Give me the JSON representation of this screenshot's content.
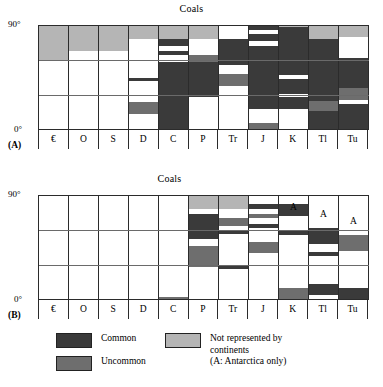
{
  "figure": {
    "panels": [
      {
        "id": "A",
        "label": "(A)",
        "title": "Coals",
        "y_axis": {
          "top": "90°",
          "bottom": "0°",
          "min": 0,
          "max": 90,
          "gridlines": [
            30,
            60
          ]
        },
        "x_axis": {
          "categories": [
            "€",
            "O",
            "S",
            "D",
            "C",
            "P",
            "Tr",
            "J",
            "K",
            "Tl",
            "Tu"
          ]
        }
      },
      {
        "id": "B",
        "label": "(B)",
        "title": "Coals",
        "y_axis": {
          "top": "90°",
          "bottom": "0°",
          "min": 0,
          "max": 90,
          "gridlines": [
            30,
            60
          ]
        },
        "x_axis": {
          "categories": [
            "€",
            "O",
            "S",
            "D",
            "C",
            "P",
            "Tr",
            "J",
            "K",
            "Tl",
            "Tu"
          ]
        },
        "antarctica_marks": [
          {
            "column": "K",
            "label": "A",
            "lat": 84
          },
          {
            "column": "Tl",
            "label": "A",
            "lat": 78
          },
          {
            "column": "Tu",
            "label": "A",
            "lat": 72
          }
        ]
      }
    ],
    "legend": {
      "items": [
        {
          "key": "common",
          "label": "Common",
          "color": "#3a3a3a"
        },
        {
          "key": "uncommon",
          "label": "Uncommon",
          "color": "#6e6e6e"
        },
        {
          "key": "not_represented",
          "label": "Not represented by\ncontinents\n(A: Antarctica only)",
          "color": "#b5b5b5"
        }
      ]
    }
  },
  "colors": {
    "common": "#3a3a3a",
    "uncommon": "#6e6e6e",
    "not_represented": "#b5b5b5",
    "absent": "#ffffff",
    "axis": "#2b2b2b",
    "grid": "#6a6a6a"
  },
  "chart_data": {
    "type": "bar",
    "title": "Coals",
    "xlabel": "",
    "ylabel": "Latitude",
    "ylim": [
      0,
      90
    ],
    "grid": true,
    "legend_position": "bottom",
    "categories": [
      "€",
      "O",
      "S",
      "D",
      "C",
      "P",
      "Tr",
      "J",
      "K",
      "Tl",
      "Tu"
    ],
    "note": "Each column is a vertical stack of latitude bands (0-90 deg); each band has a category: common, uncommon, not_represented, or absent.",
    "panels": [
      {
        "id": "A",
        "columns": [
          {
            "name": "€",
            "bands": [
              {
                "from": 0,
                "to": 60,
                "state": "absent"
              },
              {
                "from": 60,
                "to": 90,
                "state": "not_represented"
              }
            ]
          },
          {
            "name": "O",
            "bands": [
              {
                "from": 0,
                "to": 68,
                "state": "absent"
              },
              {
                "from": 68,
                "to": 90,
                "state": "not_represented"
              }
            ]
          },
          {
            "name": "S",
            "bands": [
              {
                "from": 0,
                "to": 68,
                "state": "absent"
              },
              {
                "from": 68,
                "to": 90,
                "state": "not_represented"
              }
            ]
          },
          {
            "name": "D",
            "bands": [
              {
                "from": 0,
                "to": 14,
                "state": "absent"
              },
              {
                "from": 14,
                "to": 24,
                "state": "uncommon"
              },
              {
                "from": 24,
                "to": 42,
                "state": "absent"
              },
              {
                "from": 42,
                "to": 45,
                "state": "common"
              },
              {
                "from": 45,
                "to": 78,
                "state": "absent"
              },
              {
                "from": 78,
                "to": 90,
                "state": "not_represented"
              }
            ]
          },
          {
            "name": "C",
            "bands": [
              {
                "from": 0,
                "to": 58,
                "state": "common"
              },
              {
                "from": 58,
                "to": 64,
                "state": "absent"
              },
              {
                "from": 64,
                "to": 68,
                "state": "common"
              },
              {
                "from": 68,
                "to": 72,
                "state": "absent"
              },
              {
                "from": 72,
                "to": 78,
                "state": "common"
              },
              {
                "from": 78,
                "to": 90,
                "state": "not_represented"
              }
            ]
          },
          {
            "name": "P",
            "bands": [
              {
                "from": 0,
                "to": 28,
                "state": "absent"
              },
              {
                "from": 28,
                "to": 58,
                "state": "common"
              },
              {
                "from": 58,
                "to": 64,
                "state": "uncommon"
              },
              {
                "from": 64,
                "to": 78,
                "state": "absent"
              },
              {
                "from": 78,
                "to": 90,
                "state": "not_represented"
              }
            ]
          },
          {
            "name": "Tr",
            "bands": [
              {
                "from": 0,
                "to": 38,
                "state": "absent"
              },
              {
                "from": 38,
                "to": 48,
                "state": "uncommon"
              },
              {
                "from": 48,
                "to": 56,
                "state": "absent"
              },
              {
                "from": 56,
                "to": 78,
                "state": "common"
              },
              {
                "from": 78,
                "to": 90,
                "state": "absent"
              }
            ]
          },
          {
            "name": "J",
            "bands": [
              {
                "from": 0,
                "to": 6,
                "state": "uncommon"
              },
              {
                "from": 6,
                "to": 18,
                "state": "absent"
              },
              {
                "from": 18,
                "to": 72,
                "state": "common"
              },
              {
                "from": 72,
                "to": 76,
                "state": "absent"
              },
              {
                "from": 76,
                "to": 82,
                "state": "common"
              },
              {
                "from": 82,
                "to": 86,
                "state": "absent"
              },
              {
                "from": 86,
                "to": 90,
                "state": "common"
              }
            ]
          },
          {
            "name": "K",
            "bands": [
              {
                "from": 0,
                "to": 18,
                "state": "absent"
              },
              {
                "from": 18,
                "to": 28,
                "state": "common"
              },
              {
                "from": 28,
                "to": 31,
                "state": "absent"
              },
              {
                "from": 31,
                "to": 44,
                "state": "common"
              },
              {
                "from": 44,
                "to": 47,
                "state": "absent"
              },
              {
                "from": 47,
                "to": 88,
                "state": "common"
              },
              {
                "from": 88,
                "to": 90,
                "state": "not_represented"
              }
            ]
          },
          {
            "name": "Tl",
            "bands": [
              {
                "from": 0,
                "to": 16,
                "state": "common"
              },
              {
                "from": 16,
                "to": 25,
                "state": "uncommon"
              },
              {
                "from": 25,
                "to": 78,
                "state": "common"
              },
              {
                "from": 78,
                "to": 90,
                "state": "not_represented"
              }
            ]
          },
          {
            "name": "Tu",
            "bands": [
              {
                "from": 0,
                "to": 22,
                "state": "common"
              },
              {
                "from": 22,
                "to": 26,
                "state": "absent"
              },
              {
                "from": 26,
                "to": 36,
                "state": "uncommon"
              },
              {
                "from": 36,
                "to": 62,
                "state": "common"
              },
              {
                "from": 62,
                "to": 80,
                "state": "absent"
              },
              {
                "from": 80,
                "to": 90,
                "state": "not_represented"
              }
            ]
          }
        ]
      },
      {
        "id": "B",
        "columns": [
          {
            "name": "€",
            "bands": [
              {
                "from": 0,
                "to": 90,
                "state": "absent"
              }
            ]
          },
          {
            "name": "O",
            "bands": [
              {
                "from": 0,
                "to": 90,
                "state": "absent"
              }
            ]
          },
          {
            "name": "S",
            "bands": [
              {
                "from": 0,
                "to": 90,
                "state": "absent"
              }
            ]
          },
          {
            "name": "D",
            "bands": [
              {
                "from": 0,
                "to": 90,
                "state": "absent"
              }
            ]
          },
          {
            "name": "C",
            "bands": [
              {
                "from": 0,
                "to": 3,
                "state": "uncommon"
              },
              {
                "from": 3,
                "to": 90,
                "state": "absent"
              }
            ]
          },
          {
            "name": "P",
            "bands": [
              {
                "from": 0,
                "to": 28,
                "state": "absent"
              },
              {
                "from": 28,
                "to": 46,
                "state": "uncommon"
              },
              {
                "from": 46,
                "to": 52,
                "state": "absent"
              },
              {
                "from": 52,
                "to": 74,
                "state": "common"
              },
              {
                "from": 74,
                "to": 78,
                "state": "absent"
              },
              {
                "from": 78,
                "to": 90,
                "state": "not_represented"
              }
            ]
          },
          {
            "name": "Tr",
            "bands": [
              {
                "from": 0,
                "to": 27,
                "state": "absent"
              },
              {
                "from": 27,
                "to": 30,
                "state": "common"
              },
              {
                "from": 30,
                "to": 57,
                "state": "absent"
              },
              {
                "from": 57,
                "to": 60,
                "state": "common"
              },
              {
                "from": 60,
                "to": 63,
                "state": "absent"
              },
              {
                "from": 63,
                "to": 70,
                "state": "uncommon"
              },
              {
                "from": 70,
                "to": 78,
                "state": "absent"
              },
              {
                "from": 78,
                "to": 90,
                "state": "not_represented"
              }
            ]
          },
          {
            "name": "J",
            "bands": [
              {
                "from": 0,
                "to": 40,
                "state": "absent"
              },
              {
                "from": 40,
                "to": 50,
                "state": "uncommon"
              },
              {
                "from": 50,
                "to": 62,
                "state": "absent"
              },
              {
                "from": 62,
                "to": 65,
                "state": "common"
              },
              {
                "from": 65,
                "to": 70,
                "state": "absent"
              },
              {
                "from": 70,
                "to": 74,
                "state": "uncommon"
              },
              {
                "from": 74,
                "to": 78,
                "state": "absent"
              },
              {
                "from": 78,
                "to": 82,
                "state": "common"
              },
              {
                "from": 82,
                "to": 90,
                "state": "absent"
              }
            ]
          },
          {
            "name": "K",
            "bands": [
              {
                "from": 0,
                "to": 10,
                "state": "uncommon"
              },
              {
                "from": 10,
                "to": 56,
                "state": "absent"
              },
              {
                "from": 56,
                "to": 60,
                "state": "common"
              },
              {
                "from": 60,
                "to": 72,
                "state": "absent"
              },
              {
                "from": 72,
                "to": 82,
                "state": "common"
              },
              {
                "from": 82,
                "to": 90,
                "state": "absent"
              }
            ]
          },
          {
            "name": "Tl",
            "bands": [
              {
                "from": 0,
                "to": 4,
                "state": "absent"
              },
              {
                "from": 4,
                "to": 14,
                "state": "common"
              },
              {
                "from": 14,
                "to": 38,
                "state": "absent"
              },
              {
                "from": 38,
                "to": 41,
                "state": "common"
              },
              {
                "from": 41,
                "to": 48,
                "state": "absent"
              },
              {
                "from": 48,
                "to": 62,
                "state": "common"
              },
              {
                "from": 62,
                "to": 90,
                "state": "absent"
              }
            ]
          },
          {
            "name": "Tu",
            "bands": [
              {
                "from": 0,
                "to": 10,
                "state": "common"
              },
              {
                "from": 10,
                "to": 42,
                "state": "absent"
              },
              {
                "from": 42,
                "to": 56,
                "state": "uncommon"
              },
              {
                "from": 56,
                "to": 90,
                "state": "absent"
              }
            ]
          }
        ]
      }
    ]
  }
}
